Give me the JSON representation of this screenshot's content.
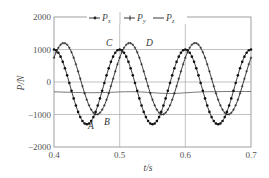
{
  "chart_data": {
    "type": "line",
    "title": "",
    "xlabel": "t/s",
    "ylabel": "P/N",
    "xlim": [
      0.4,
      0.7
    ],
    "ylim": [
      -2000,
      2000
    ],
    "xticks": [
      "0.4",
      "0.5",
      "0.6",
      "0.7"
    ],
    "yticks": [
      "2000",
      "1000",
      "0",
      "-1000",
      "-2000"
    ],
    "grid": true,
    "legend_position": "top",
    "series": [
      {
        "name": "Px",
        "marker": "dot",
        "amplitude_pos": 1000,
        "amplitude_neg": -1300,
        "period": 0.1,
        "x": [
          0.4,
          0.425,
          0.45,
          0.475,
          0.5,
          0.525,
          0.55,
          0.575,
          0.6,
          0.625,
          0.65,
          0.675,
          0.7
        ],
        "values": [
          1000,
          -150,
          -1300,
          -150,
          1000,
          -150,
          -1300,
          -150,
          1000,
          -150,
          -1300,
          -150,
          1000
        ]
      },
      {
        "name": "Py",
        "marker": "plus",
        "amplitude_pos": 1200,
        "amplitude_neg": -1000,
        "period": 0.1,
        "x": [
          0.4,
          0.415,
          0.44,
          0.465,
          0.49,
          0.515,
          0.54,
          0.565,
          0.59,
          0.615,
          0.64,
          0.665,
          0.69,
          0.7
        ],
        "values": [
          0,
          1200,
          100,
          -1000,
          100,
          1200,
          100,
          -1000,
          100,
          1200,
          100,
          -1000,
          100,
          600
        ]
      },
      {
        "name": "Pz",
        "marker": "none",
        "x": [
          0.4,
          0.45,
          0.5,
          0.55,
          0.6,
          0.65,
          0.7
        ],
        "values": [
          -300,
          -330,
          -290,
          -340,
          -300,
          -330,
          -290
        ]
      }
    ],
    "annotations": [
      {
        "text": "A",
        "x": 0.45,
        "y": -1300
      },
      {
        "text": "B",
        "x": 0.475,
        "y": -1000
      },
      {
        "text": "C",
        "x": 0.5,
        "y": 1000
      },
      {
        "text": "D",
        "x": 0.515,
        "y": 1200
      }
    ]
  },
  "legend": {
    "px_label": "P",
    "px_sub": "x",
    "py_label": "P",
    "py_sub": "y",
    "pz_label": "P",
    "pz_sub": "z"
  },
  "axes": {
    "xlabel": "t/s",
    "ylabel": "P/N",
    "xticks": [
      "0.4",
      "0.5",
      "0.6",
      "0.7"
    ],
    "yticks": [
      "2000",
      "1000",
      "0",
      "−1000",
      "−2000"
    ]
  },
  "annotations": {
    "A": "A",
    "B": "B",
    "C": "C",
    "D": "D"
  }
}
